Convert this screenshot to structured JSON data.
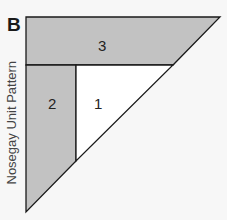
{
  "figure": {
    "label": "B",
    "side_label": "Nosegay Unit Pattern",
    "pieces": [
      {
        "id": "1",
        "label": "1",
        "fill": "#ffffff"
      },
      {
        "id": "2",
        "label": "2",
        "fill": "#c2c2c2"
      },
      {
        "id": "3",
        "label": "3",
        "fill": "#c2c2c2"
      }
    ],
    "colors": {
      "background": "#f7f7f7",
      "stroke": "#1a1a1a",
      "shade": "#c2c2c2"
    }
  }
}
